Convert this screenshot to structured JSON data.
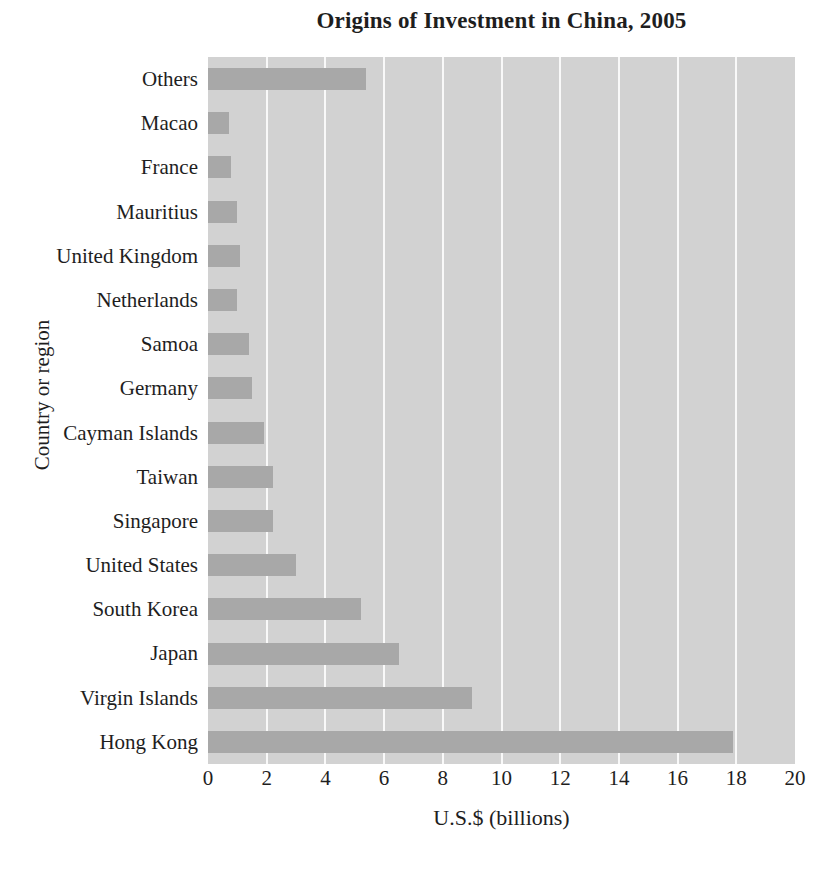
{
  "title": "Origins of Investment in China, 2005",
  "colors": {
    "page_bg": "#ffffff",
    "plot_bg": "#d2d2d2",
    "bar": "#a8a8a8",
    "gridline": "#f9f9f9",
    "text": "#1e1e1e"
  },
  "chart_data": {
    "type": "bar",
    "orientation": "horizontal",
    "title": "Origins of Investment in China, 2005",
    "xlabel": "U.S.$ (billions)",
    "ylabel": "Country or region",
    "xlim": [
      0,
      20
    ],
    "xticks": [
      0,
      2,
      4,
      6,
      8,
      10,
      12,
      14,
      16,
      18,
      20
    ],
    "grid": true,
    "legend": false,
    "categories": [
      "Others",
      "Macao",
      "France",
      "Mauritius",
      "United Kingdom",
      "Netherlands",
      "Samoa",
      "Germany",
      "Cayman Islands",
      "Taiwan",
      "Singapore",
      "United States",
      "South Korea",
      "Japan",
      "Virgin Islands",
      "Hong Kong"
    ],
    "values": [
      5.4,
      0.7,
      0.8,
      1.0,
      1.1,
      1.0,
      1.4,
      1.5,
      1.9,
      2.2,
      2.2,
      3.0,
      5.2,
      6.5,
      9.0,
      17.9
    ]
  }
}
